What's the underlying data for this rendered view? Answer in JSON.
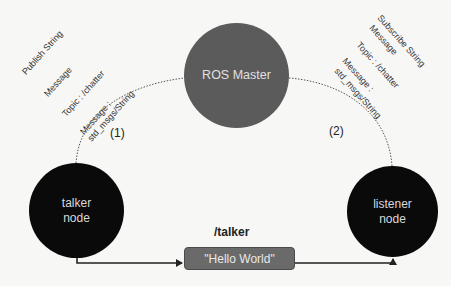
{
  "diagram": {
    "master": {
      "label": "ROS Master",
      "color": "#5b5b5b"
    },
    "talker": {
      "line1": "talker",
      "line2": "node",
      "color": "#0a0a0a"
    },
    "listener": {
      "line1": "listener",
      "line2": "node",
      "color": "#0a0a0a"
    },
    "publish_annotation": {
      "line1": "Publish String",
      "line2": "Message",
      "line3": "Topic : /chatter",
      "line4": "Message :",
      "line5": "std_msgs/String"
    },
    "subscribe_annotation": {
      "line1": "Subscribe String",
      "line2": "Message",
      "line3": "Topic : /chatter",
      "line4": "Message :",
      "line5": "std_msgs/String"
    },
    "steps": {
      "step1": "(1)",
      "step2": "(2)"
    },
    "topic": {
      "label": "/talker",
      "message": "\"Hello World\""
    },
    "colors": {
      "background": "#f7f7f5",
      "message_box": "#6a6a6a",
      "line": "#222222"
    }
  }
}
